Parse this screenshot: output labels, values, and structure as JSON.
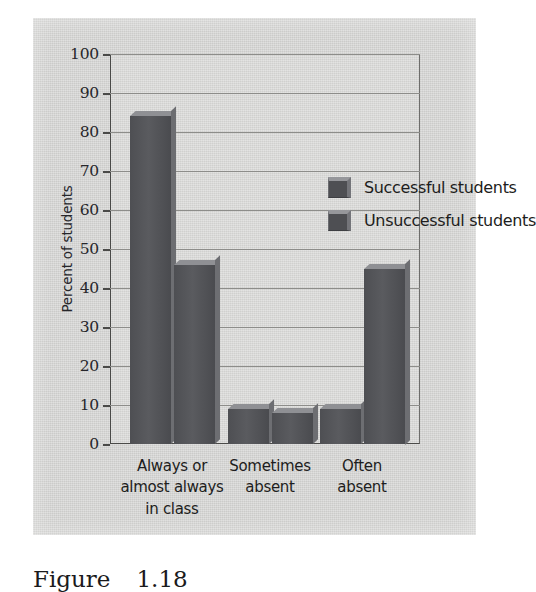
{
  "chart_data": {
    "type": "bar",
    "title": "",
    "xlabel": "",
    "ylabel": "Percent of students",
    "ylim": [
      0,
      100
    ],
    "ytick_step": 10,
    "yticks": [
      0,
      10,
      20,
      30,
      40,
      50,
      60,
      70,
      80,
      90,
      100
    ],
    "grid": true,
    "legend_position": "inside top-right",
    "categories": [
      "Always or\nalmost always\nin class",
      "Sometimes\nabsent",
      "Often\nabsent"
    ],
    "category_lines": [
      [
        "Always or",
        "almost always",
        "in class"
      ],
      [
        "Sometimes",
        "absent"
      ],
      [
        "Often",
        "absent"
      ]
    ],
    "series": [
      {
        "name": "Successful students",
        "values": [
          84,
          9,
          9
        ],
        "color": "#4e4f53"
      },
      {
        "name": "Unsuccessful students",
        "values": [
          46,
          8,
          45
        ],
        "color": "#4e4f53"
      }
    ]
  },
  "axis": {
    "y_title": "Percent of students",
    "tick_labels": [
      "100",
      "90",
      "80",
      "70",
      "60",
      "50",
      "40",
      "30",
      "20",
      "10",
      "0"
    ]
  },
  "legend": {
    "items": [
      {
        "label": "Successful students"
      },
      {
        "label": "Unsuccessful students"
      }
    ]
  },
  "caption": {
    "word": "Figure",
    "number": "1.18"
  },
  "colors": {
    "panel_background": "#d2d2d0",
    "bar_fill": "#4e4f53",
    "bar_highlight": "#8f9094",
    "gridline": "#8d8d8a",
    "axis": "#4a4a48",
    "text": "#1d1d20"
  }
}
